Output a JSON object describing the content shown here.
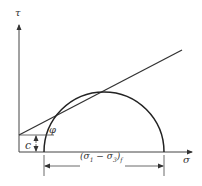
{
  "diagram": {
    "axes": {
      "y_label": "τ",
      "x_label": "σ"
    },
    "labels": {
      "cohesion": "c",
      "friction_angle": "φ",
      "diameter": "(σ1 − σ3)f"
    },
    "diameter_label_parts": {
      "main": "(σ",
      "sub1": "1",
      "mid": " − σ",
      "sub3": "3",
      "close": ")",
      "subf": "f"
    },
    "colors": {
      "line": "#333333",
      "background": "#ffffff"
    }
  }
}
